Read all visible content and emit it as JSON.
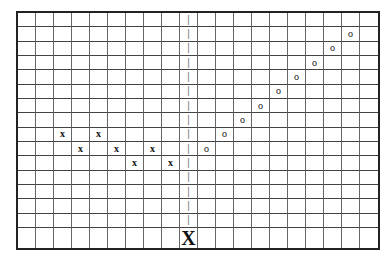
{
  "board": {
    "columns": 20,
    "rows": 16,
    "line_color": "#444444",
    "border_color": "#222222",
    "divider_column": 9,
    "divider_glyph": "|",
    "divider_rows": [
      0,
      1,
      2,
      3,
      4,
      5,
      6,
      7,
      8,
      9,
      10,
      11,
      12,
      13,
      14
    ],
    "cursor": {
      "col": 9,
      "row": 15,
      "glyph": "X"
    },
    "x_marks": [
      {
        "col": 2,
        "row": 8
      },
      {
        "col": 4,
        "row": 8
      },
      {
        "col": 3,
        "row": 9
      },
      {
        "col": 5,
        "row": 9
      },
      {
        "col": 7,
        "row": 9
      },
      {
        "col": 6,
        "row": 10
      },
      {
        "col": 8,
        "row": 10
      }
    ],
    "o_marks": [
      {
        "col": 18,
        "row": 1
      },
      {
        "col": 17,
        "row": 2
      },
      {
        "col": 16,
        "row": 3
      },
      {
        "col": 15,
        "row": 4
      },
      {
        "col": 14,
        "row": 5
      },
      {
        "col": 13,
        "row": 6
      },
      {
        "col": 12,
        "row": 7
      },
      {
        "col": 11,
        "row": 8
      },
      {
        "col": 10,
        "row": 9
      }
    ],
    "glyphs": {
      "x": "x",
      "o": "o"
    }
  }
}
